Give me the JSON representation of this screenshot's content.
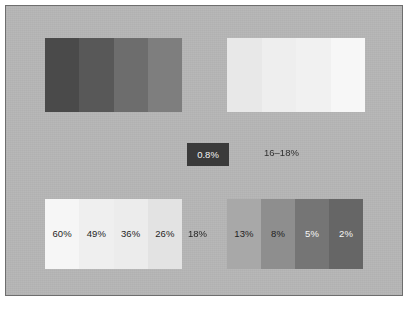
{
  "figure": {
    "background_color": "#b8b8b8",
    "border_color": "#6e6e6e",
    "page_color": "#ffffff"
  },
  "chart_data": {
    "type": "table",
    "title": "",
    "subtitle": "",
    "xlabel": "",
    "ylabel": "",
    "series": [
      {
        "name": "top-left-block",
        "values": [
          null,
          null,
          null,
          null
        ],
        "colors": [
          "#4a4a4a",
          "#585858",
          "#6d6d6d",
          "#7e7e7e"
        ]
      },
      {
        "name": "top-right-block",
        "values": [
          null,
          null,
          null,
          null
        ],
        "colors": [
          "#e8e8e8",
          "#eeeeee",
          "#f1f1f1",
          "#f7f7f7"
        ]
      },
      {
        "name": "bottom-left-block",
        "values": [
          60,
          49,
          36,
          26
        ],
        "colors": [
          "#f6f6f6",
          "#efefef",
          "#ececec",
          "#e3e3e3"
        ]
      },
      {
        "name": "bottom-right-block",
        "values": [
          13,
          8,
          5,
          2
        ],
        "colors": [
          "#a8a8a8",
          "#8e8e8e",
          "#757575",
          "#666666"
        ]
      }
    ],
    "annotations": [
      "0.8%",
      "16–18%",
      "18%"
    ]
  },
  "blocks": {
    "top_left": {
      "name": "top-left-swatch-block",
      "swatches": [
        {
          "color": "#4a4a4a",
          "label": "",
          "label_color": "#ffffff"
        },
        {
          "color": "#585858",
          "label": "",
          "label_color": "#ffffff"
        },
        {
          "color": "#6d6d6d",
          "label": "",
          "label_color": "#ffffff"
        },
        {
          "color": "#7e7e7e",
          "label": "",
          "label_color": "#ffffff"
        }
      ]
    },
    "top_right": {
      "name": "top-right-swatch-block",
      "swatches": [
        {
          "color": "#e8e8e8",
          "label": "",
          "label_color": "#252525"
        },
        {
          "color": "#eeeeee",
          "label": "",
          "label_color": "#252525"
        },
        {
          "color": "#f1f1f1",
          "label": "",
          "label_color": "#252525"
        },
        {
          "color": "#f7f7f7",
          "label": "",
          "label_color": "#252525"
        }
      ]
    },
    "bottom_left": {
      "name": "bottom-left-swatch-block",
      "swatches": [
        {
          "color": "#f6f6f6",
          "label": "60%",
          "label_color": "#252525"
        },
        {
          "color": "#efefef",
          "label": "49%",
          "label_color": "#252525"
        },
        {
          "color": "#ececec",
          "label": "36%",
          "label_color": "#252525"
        },
        {
          "color": "#e3e3e3",
          "label": "26%",
          "label_color": "#252525"
        }
      ]
    },
    "bottom_right": {
      "name": "bottom-right-swatch-block",
      "swatches": [
        {
          "color": "#a8a8a8",
          "label": "13%",
          "label_color": "#1f1f1f"
        },
        {
          "color": "#8e8e8e",
          "label": "8%",
          "label_color": "#1f1f1f"
        },
        {
          "color": "#757575",
          "label": "5%",
          "label_color": "#f5f5f5"
        },
        {
          "color": "#666666",
          "label": "2%",
          "label_color": "#f5f5f5"
        }
      ]
    }
  },
  "callouts": {
    "dark_box": {
      "text": "0.8%",
      "background_color": "#3a3a3a",
      "text_color": "#f2f2f2"
    },
    "plain": {
      "text": "16–18%",
      "text_color": "#303030"
    },
    "gap_label": {
      "text": "18%",
      "text_color": "#252525"
    }
  }
}
